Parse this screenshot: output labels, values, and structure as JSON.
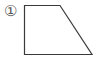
{
  "figure": {
    "label": "①",
    "shape": "right-trapezoid",
    "stroke_color": "#3a3a3a",
    "vertices": [
      [
        24,
        5
      ],
      [
        60,
        5
      ],
      [
        92,
        54
      ],
      [
        24,
        54
      ]
    ]
  }
}
